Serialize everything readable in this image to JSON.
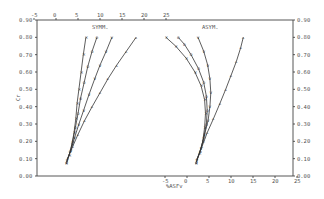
{
  "chart_data": [
    {
      "type": "line",
      "title": "SYMM.",
      "xlabel": "",
      "ylabel": "Cr",
      "x_axis_position": "top",
      "xlim": [
        -5,
        25
      ],
      "ylim": [
        0.0,
        0.9
      ],
      "xticks": [
        "-5",
        "0",
        "5",
        "10",
        "15",
        "20",
        "25"
      ],
      "yticks": [
        "0.00",
        "0.10",
        "0.20",
        "0.30",
        "0.40",
        "0.50",
        "0.60",
        "0.70",
        "0.80",
        "0.90"
      ],
      "grid": false,
      "series": [
        {
          "name": "S1",
          "marker": "x",
          "points": [
            [
              2.3,
              0.07
            ],
            [
              3.0,
              0.12
            ],
            [
              3.6,
              0.18
            ],
            [
              4.1,
              0.25
            ],
            [
              4.5,
              0.33
            ],
            [
              4.8,
              0.42
            ],
            [
              5.2,
              0.5
            ],
            [
              5.7,
              0.6
            ],
            [
              6.2,
              0.7
            ],
            [
              6.8,
              0.8
            ]
          ]
        },
        {
          "name": "S2",
          "marker": "o",
          "points": [
            [
              2.4,
              0.08
            ],
            [
              3.2,
              0.14
            ],
            [
              3.8,
              0.2
            ],
            [
              4.4,
              0.28
            ],
            [
              5.0,
              0.36
            ],
            [
              5.6,
              0.45
            ],
            [
              6.4,
              0.54
            ],
            [
              7.2,
              0.63
            ],
            [
              8.2,
              0.72
            ],
            [
              9.3,
              0.8
            ]
          ]
        },
        {
          "name": "S3",
          "marker": "v",
          "points": [
            [
              2.5,
              0.09
            ],
            [
              3.4,
              0.15
            ],
            [
              4.2,
              0.22
            ],
            [
              5.2,
              0.3
            ],
            [
              6.3,
              0.38
            ],
            [
              7.5,
              0.47
            ],
            [
              8.8,
              0.56
            ],
            [
              10.0,
              0.64
            ],
            [
              11.4,
              0.72
            ],
            [
              12.7,
              0.8
            ]
          ]
        },
        {
          "name": "S4",
          "marker": "^",
          "points": [
            [
              2.6,
              0.1
            ],
            [
              3.8,
              0.17
            ],
            [
              5.0,
              0.24
            ],
            [
              6.5,
              0.32
            ],
            [
              8.2,
              0.4
            ],
            [
              10.0,
              0.48
            ],
            [
              11.8,
              0.56
            ],
            [
              13.8,
              0.64
            ],
            [
              16.0,
              0.72
            ],
            [
              18.2,
              0.8
            ]
          ]
        }
      ]
    },
    {
      "type": "line",
      "title": "ASYM.",
      "xlabel": "%ASFv",
      "ylabel": "",
      "x_axis_position": "bottom",
      "xlim": [
        -5,
        25
      ],
      "ylim": [
        0.0,
        0.9
      ],
      "xticks": [
        "-5",
        "0",
        "5",
        "10",
        "15",
        "20",
        "25"
      ],
      "yticks": [
        "0.00",
        "0.10",
        "0.20",
        "0.30",
        "0.40",
        "0.50",
        "0.60",
        "0.70",
        "0.80",
        "0.90"
      ],
      "grid": false,
      "series": [
        {
          "name": "A1",
          "marker": "x",
          "points": [
            [
              2.0,
              0.07
            ],
            [
              2.8,
              0.13
            ],
            [
              3.6,
              0.2
            ],
            [
              4.0,
              0.28
            ],
            [
              4.2,
              0.36
            ],
            [
              4.0,
              0.44
            ],
            [
              3.2,
              0.52
            ],
            [
              1.8,
              0.6
            ],
            [
              -0.2,
              0.68
            ],
            [
              -2.6,
              0.75
            ],
            [
              -4.8,
              0.8
            ]
          ]
        },
        {
          "name": "A2",
          "marker": "o",
          "points": [
            [
              2.1,
              0.08
            ],
            [
              3.0,
              0.14
            ],
            [
              3.8,
              0.22
            ],
            [
              4.4,
              0.3
            ],
            [
              4.6,
              0.38
            ],
            [
              4.4,
              0.46
            ],
            [
              3.8,
              0.54
            ],
            [
              2.6,
              0.62
            ],
            [
              0.9,
              0.7
            ],
            [
              -0.6,
              0.76
            ],
            [
              -2.0,
              0.8
            ]
          ]
        },
        {
          "name": "A3",
          "marker": "v",
          "points": [
            [
              2.2,
              0.09
            ],
            [
              3.2,
              0.16
            ],
            [
              4.0,
              0.24
            ],
            [
              4.8,
              0.32
            ],
            [
              5.2,
              0.4
            ],
            [
              5.4,
              0.48
            ],
            [
              5.2,
              0.56
            ],
            [
              4.7,
              0.64
            ],
            [
              3.8,
              0.72
            ],
            [
              2.5,
              0.8
            ]
          ]
        },
        {
          "name": "A4",
          "marker": "^",
          "points": [
            [
              2.3,
              0.1
            ],
            [
              3.4,
              0.17
            ],
            [
              4.6,
              0.25
            ],
            [
              6.0,
              0.33
            ],
            [
              7.5,
              0.42
            ],
            [
              8.8,
              0.5
            ],
            [
              10.0,
              0.58
            ],
            [
              11.2,
              0.66
            ],
            [
              12.2,
              0.74
            ],
            [
              12.8,
              0.8
            ]
          ]
        }
      ]
    }
  ],
  "labels": {
    "left_title": "SYMM.",
    "right_title": "ASYM.",
    "ylabel": "Cr",
    "xlabel": "%ASFv"
  },
  "top_ticks": [
    "-5",
    "0",
    "5",
    "10",
    "15",
    "20",
    "25"
  ],
  "bottom_ticks": [
    "-5",
    "0",
    "5",
    "10",
    "15",
    "20",
    "25"
  ],
  "left_yticks": [
    "0.00",
    "0.10",
    "0.20",
    "0.30",
    "0.40",
    "0.50",
    "0.60",
    "0.70",
    "0.80",
    "0.90"
  ],
  "right_yticks": [
    "0.00",
    "0.10",
    "0.20",
    "0.30",
    "0.40",
    "0.50",
    "0.60",
    "0.70",
    "0.80",
    "0.90"
  ]
}
